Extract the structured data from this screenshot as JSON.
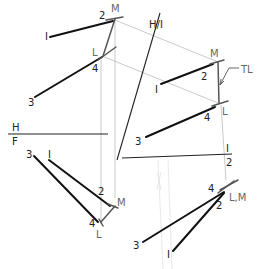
{
  "diagram": {
    "views": {
      "top": {
        "labels": {
          "p1": "I",
          "p2": "2",
          "p3": "3",
          "p4": "4",
          "L": "L",
          "M": "M"
        }
      },
      "auxiliary_1": {
        "labels": {
          "p1": "I",
          "p2": "2",
          "p4": "4",
          "L": "L",
          "M": "M",
          "true_length": "TL"
        }
      },
      "front": {
        "labels": {
          "p1": "I",
          "p2": "2",
          "p3": "3",
          "p4": "4",
          "L": "L",
          "M": "M"
        }
      },
      "auxiliary_2": {
        "labels": {
          "p1": "I",
          "p2": "2",
          "p3": "3",
          "p4": "4",
          "point_view": "L,M"
        }
      }
    },
    "fold_lines": {
      "hf": {
        "top": "H",
        "bottom": "F"
      },
      "h1": {
        "label": "H/I"
      },
      "12": {
        "top": "I",
        "bottom": "2"
      }
    },
    "annotations": {
      "mid_3": "3"
    }
  }
}
